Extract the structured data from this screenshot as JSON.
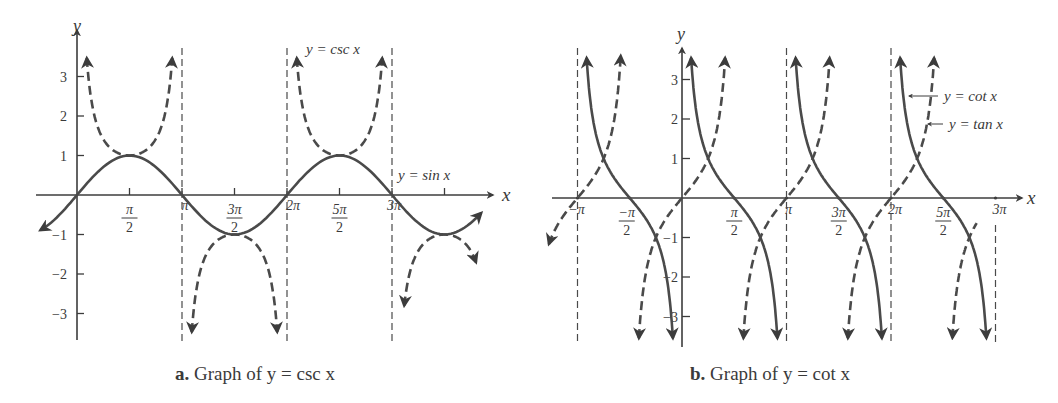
{
  "chart_data": [
    {
      "type": "line",
      "id": "a",
      "caption_prefix": "a.",
      "caption": "Graph of y = csc x",
      "xlabel": "x",
      "ylabel": "y",
      "xlim_pi": [
        -0.5,
        3.9
      ],
      "ylim": [
        -3.6,
        3.7
      ],
      "x_ticks": [
        "π/2",
        "π",
        "3π/2",
        "2π",
        "5π/2",
        "3π",
        "7π/2"
      ],
      "x_tick_labels": [
        "π/2",
        "π",
        "3π/2",
        "2π",
        "5π/2",
        "3π"
      ],
      "y_ticks": [
        -3,
        -2,
        -1,
        1,
        2,
        3
      ],
      "asymptotes_pi": [
        1,
        2,
        3
      ],
      "series": [
        {
          "name": "y = sin x",
          "style": "solid",
          "domain_pi": [
            -0.35,
            3.85
          ]
        },
        {
          "name": "y = csc x",
          "style": "dashed",
          "domain_pi": [
            0,
            3.8
          ]
        }
      ],
      "annotations": [
        "y = csc x",
        "y = sin x"
      ]
    },
    {
      "type": "line",
      "id": "b",
      "caption_prefix": "b.",
      "caption": "Graph of y = cot x",
      "xlabel": "x",
      "ylabel": "y",
      "xlim_pi": [
        -1.2,
        3.1
      ],
      "ylim": [
        -3.6,
        3.7
      ],
      "x_tick_labels": [
        "−π",
        "−π/2",
        "π/2",
        "π",
        "3π/2",
        "2π",
        "5π/2",
        "3π"
      ],
      "y_ticks": [
        -3,
        -2,
        -1,
        1,
        2,
        3
      ],
      "asymptotes_pi": [
        -1,
        1,
        2,
        3
      ],
      "series": [
        {
          "name": "y = cot x",
          "style": "solid"
        },
        {
          "name": "y = tan x",
          "style": "dashed"
        }
      ],
      "annotations": [
        "y = cot x",
        "y = tan x"
      ]
    }
  ],
  "labels": {
    "a_csc": "y = csc x",
    "a_sin": "y = sin x",
    "b_cot": "y = cot x",
    "b_tan": "y = tan x"
  }
}
